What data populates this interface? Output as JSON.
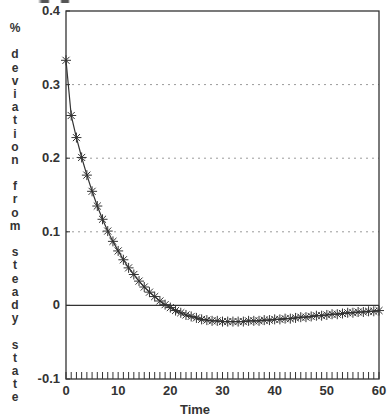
{
  "chart_data": {
    "type": "line",
    "title": "",
    "xlabel": "Time",
    "ylabel": "% deviation from steady state",
    "xlim": [
      0,
      60
    ],
    "ylim": [
      -0.1,
      0.4
    ],
    "x_ticks": [
      "0",
      "10",
      "20",
      "30",
      "40",
      "50",
      "60"
    ],
    "y_ticks": [
      "0.4",
      "0.3",
      "0.2",
      "0.1",
      "0",
      "-0.1"
    ],
    "grid": {
      "horizontal_dotted_at": [
        0.1,
        0.2,
        0.3
      ],
      "zero_line": true
    },
    "minor_x_ticks_every": 1,
    "marker": "asterisk",
    "series": [
      {
        "name": "deviation",
        "x": [
          0,
          1,
          2,
          3,
          4,
          5,
          6,
          7,
          8,
          9,
          10,
          11,
          12,
          13,
          14,
          15,
          16,
          17,
          18,
          19,
          20,
          21,
          22,
          23,
          24,
          25,
          26,
          27,
          28,
          29,
          30,
          31,
          32,
          33,
          34,
          35,
          36,
          37,
          38,
          39,
          40,
          41,
          42,
          43,
          44,
          45,
          46,
          47,
          48,
          49,
          50,
          51,
          52,
          53,
          54,
          55,
          56,
          57,
          58,
          59,
          60
        ],
        "values": [
          0.333,
          0.258,
          0.228,
          0.201,
          0.177,
          0.155,
          0.135,
          0.117,
          0.101,
          0.087,
          0.074,
          0.062,
          0.051,
          0.042,
          0.033,
          0.025,
          0.018,
          0.012,
          0.006,
          0.001,
          -0.003,
          -0.007,
          -0.01,
          -0.013,
          -0.015,
          -0.017,
          -0.019,
          -0.02,
          -0.021,
          -0.021,
          -0.022,
          -0.022,
          -0.022,
          -0.022,
          -0.022,
          -0.021,
          -0.021,
          -0.021,
          -0.02,
          -0.02,
          -0.019,
          -0.019,
          -0.018,
          -0.018,
          -0.017,
          -0.016,
          -0.016,
          -0.015,
          -0.014,
          -0.014,
          -0.013,
          -0.012,
          -0.012,
          -0.011,
          -0.01,
          -0.01,
          -0.009,
          -0.009,
          -0.008,
          -0.008,
          -0.007
        ]
      }
    ]
  },
  "labels": {
    "ylabel_words": [
      [
        "%"
      ],
      [
        "d",
        "e",
        "v",
        "i",
        "a",
        "t",
        "i",
        "o",
        "n"
      ],
      [
        "f",
        "r",
        "o",
        "m"
      ],
      [
        "s",
        "t",
        "e",
        "a",
        "d",
        "y"
      ],
      [
        "s",
        "t",
        "a",
        "t",
        "e"
      ]
    ]
  },
  "colors": {
    "ink": "#333333",
    "grid": "#9a9a9a",
    "background": "#ffffff"
  }
}
